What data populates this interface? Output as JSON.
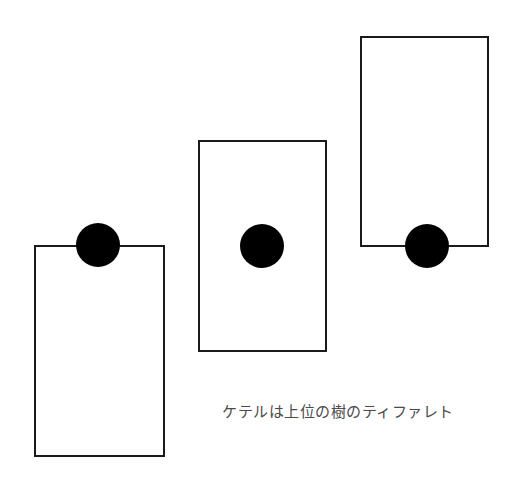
{
  "diagram": {
    "caption": "ケテルは上位の樹のティファレト",
    "colors": {
      "background": "#ffffff",
      "stroke": "#1a1a1a",
      "node_fill": "#000000",
      "caption": "#4a4a4a"
    },
    "trees": [
      {
        "label": "lower-tree",
        "rect": {
          "x": 35,
          "y": 246,
          "width": 129,
          "height": 210
        },
        "node": {
          "cx": 98,
          "cy": 245,
          "r": 22,
          "position": "top-edge"
        }
      },
      {
        "label": "middle-tree",
        "rect": {
          "x": 199,
          "y": 141,
          "width": 127,
          "height": 210
        },
        "node": {
          "cx": 262,
          "cy": 246,
          "r": 22,
          "position": "center"
        }
      },
      {
        "label": "upper-tree",
        "rect": {
          "x": 361,
          "y": 37,
          "width": 127,
          "height": 209
        },
        "node": {
          "cx": 427,
          "cy": 246,
          "r": 22,
          "position": "bottom-edge"
        }
      }
    ]
  }
}
